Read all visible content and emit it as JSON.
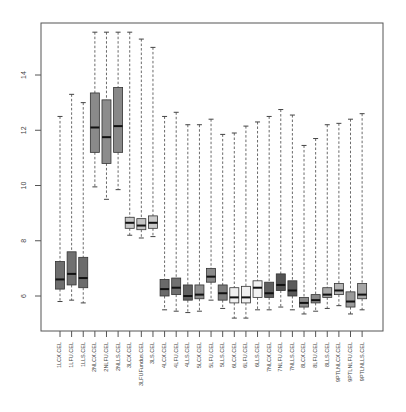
{
  "chart_data": {
    "type": "boxplot",
    "title": "",
    "xlabel": "",
    "ylabel": "",
    "ylim": [
      4.8,
      15.9
    ],
    "y_ticks": [
      6,
      8,
      10,
      12,
      14
    ],
    "grid": false,
    "legend": null,
    "categories": [
      "1LCX.CEL",
      "1LFU.CEL",
      "1LLS.CEL",
      "2NLCX.CEL",
      "2NLFU.CEL",
      "2NLLS.CEL",
      "3LCX.CEL",
      "3LFUFundus.CEL",
      "3LS.CEL",
      "4LCX.CEL",
      "4LFU.CEL",
      "4LLS.CEL",
      "5LCX.CEL",
      "5LFU.CEL",
      "5LLS.CEL",
      "6LCX.CEL",
      "6LFU.CEL",
      "6LLS.CEL",
      "7NLCX.CEL",
      "7NLFU.CEL",
      "7NLLS.CEL",
      "8LCX.CEL",
      "8LFU.CEL",
      "8LLS.CEL",
      "9PTLNLCX.CEL",
      "9PTLNLFU.CEL",
      "9PTLNLLS.CEL"
    ],
    "boxes": [
      {
        "label": "1LCX.CEL",
        "whisker_low": 5.8,
        "q1": 6.25,
        "median": 6.6,
        "q3": 7.25,
        "whisker_high": 12.5,
        "fill": "#6e6e6e"
      },
      {
        "label": "1LFU.CEL",
        "whisker_low": 5.85,
        "q1": 6.4,
        "median": 6.8,
        "q3": 7.6,
        "whisker_high": 13.3,
        "fill": "#707070"
      },
      {
        "label": "1LLS.CEL",
        "whisker_low": 5.75,
        "q1": 6.3,
        "median": 6.65,
        "q3": 7.4,
        "whisker_high": 13.0,
        "fill": "#6c6c6c"
      },
      {
        "label": "2NLCX.CEL",
        "whisker_low": 9.95,
        "q1": 11.2,
        "median": 12.1,
        "q3": 13.35,
        "whisker_high": 15.55,
        "fill": "#8a8a8a"
      },
      {
        "label": "2NLFU.CEL",
        "whisker_low": 9.5,
        "q1": 10.8,
        "median": 11.75,
        "q3": 13.1,
        "whisker_high": 15.55,
        "fill": "#8c8c8c"
      },
      {
        "label": "2NLLS.CEL",
        "whisker_low": 9.85,
        "q1": 11.2,
        "median": 12.15,
        "q3": 13.55,
        "whisker_high": 15.55,
        "fill": "#888888"
      },
      {
        "label": "3LCX.CEL",
        "whisker_low": 8.2,
        "q1": 8.45,
        "median": 8.65,
        "q3": 8.85,
        "whisker_high": 15.55,
        "fill": "#c8c8c8"
      },
      {
        "label": "3LFUFundus.CEL",
        "whisker_low": 8.1,
        "q1": 8.4,
        "median": 8.55,
        "q3": 8.8,
        "whisker_high": 15.3,
        "fill": "#c4c4c4"
      },
      {
        "label": "3LS.CEL",
        "whisker_low": 8.15,
        "q1": 8.45,
        "median": 8.65,
        "q3": 8.9,
        "whisker_high": 15.0,
        "fill": "#cacaca"
      },
      {
        "label": "4LCX.CEL",
        "whisker_low": 5.5,
        "q1": 6.0,
        "median": 6.25,
        "q3": 6.6,
        "whisker_high": 12.5,
        "fill": "#6a6a6a"
      },
      {
        "label": "4LFU.CEL",
        "whisker_low": 5.45,
        "q1": 6.05,
        "median": 6.3,
        "q3": 6.65,
        "whisker_high": 12.65,
        "fill": "#707070"
      },
      {
        "label": "4LLS.CEL",
        "whisker_low": 5.4,
        "q1": 5.85,
        "median": 6.0,
        "q3": 6.4,
        "whisker_high": 12.2,
        "fill": "#606060"
      },
      {
        "label": "5LCX.CEL",
        "whisker_low": 5.45,
        "q1": 5.9,
        "median": 6.05,
        "q3": 6.4,
        "whisker_high": 12.2,
        "fill": "#8e8e8e"
      },
      {
        "label": "5LFU.CEL",
        "whisker_low": 5.85,
        "q1": 6.5,
        "median": 6.7,
        "q3": 7.0,
        "whisker_high": 12.4,
        "fill": "#8a8a8a"
      },
      {
        "label": "5LLS.CEL",
        "whisker_low": 5.55,
        "q1": 5.85,
        "median": 6.1,
        "q3": 6.4,
        "whisker_high": 11.85,
        "fill": "#7c7c7c"
      },
      {
        "label": "6LCX.CEL",
        "whisker_low": 5.2,
        "q1": 5.75,
        "median": 5.95,
        "q3": 6.3,
        "whisker_high": 11.9,
        "fill": "#f0f0f0"
      },
      {
        "label": "6LFU.CEL",
        "whisker_low": 5.2,
        "q1": 5.75,
        "median": 5.95,
        "q3": 6.35,
        "whisker_high": 12.15,
        "fill": "#f0f0f0"
      },
      {
        "label": "6LLS.CEL",
        "whisker_low": 5.5,
        "q1": 5.95,
        "median": 6.3,
        "q3": 6.55,
        "whisker_high": 12.3,
        "fill": "#f2f2f2"
      },
      {
        "label": "7NLCX.CEL",
        "whisker_low": 5.5,
        "q1": 5.95,
        "median": 6.1,
        "q3": 6.5,
        "whisker_high": 12.5,
        "fill": "#5e5e5e"
      },
      {
        "label": "7NLFU.CEL",
        "whisker_low": 5.6,
        "q1": 6.2,
        "median": 6.4,
        "q3": 6.8,
        "whisker_high": 12.75,
        "fill": "#545454"
      },
      {
        "label": "7NLLS.CEL",
        "whisker_low": 5.5,
        "q1": 6.0,
        "median": 6.2,
        "q3": 6.55,
        "whisker_high": 12.55,
        "fill": "#5a5a5a"
      },
      {
        "label": "8LCX.CEL",
        "whisker_low": 5.35,
        "q1": 5.6,
        "median": 5.75,
        "q3": 5.95,
        "whisker_high": 11.45,
        "fill": "#8c8c8c"
      },
      {
        "label": "8LFU.CEL",
        "whisker_low": 5.45,
        "q1": 5.75,
        "median": 5.85,
        "q3": 6.05,
        "whisker_high": 11.7,
        "fill": "#8a8a8a"
      },
      {
        "label": "8LLS.CEL",
        "whisker_low": 5.55,
        "q1": 5.95,
        "median": 6.05,
        "q3": 6.3,
        "whisker_high": 12.2,
        "fill": "#a8a8a8"
      },
      {
        "label": "9PTLNLCX.CEL",
        "whisker_low": 5.65,
        "q1": 6.05,
        "median": 6.2,
        "q3": 6.45,
        "whisker_high": 12.25,
        "fill": "#b4b4b4"
      },
      {
        "label": "9PTLNLFU.CEL",
        "whisker_low": 5.35,
        "q1": 5.6,
        "median": 5.8,
        "q3": 6.15,
        "whisker_high": 12.4,
        "fill": "#9a9a9a"
      },
      {
        "label": "9PTLNLLS.CEL",
        "whisker_low": 5.5,
        "q1": 5.9,
        "median": 6.05,
        "q3": 6.45,
        "whisker_high": 12.6,
        "fill": "#a6a6a6"
      }
    ]
  },
  "colors": {
    "frame": "#555555",
    "whisker": "#444444",
    "median": "#111111",
    "box_border": "#333333"
  }
}
